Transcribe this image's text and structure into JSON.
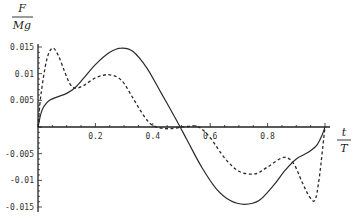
{
  "chart_data": {
    "type": "line",
    "title": "",
    "xlabel": "t / T",
    "ylabel": "F / Mg",
    "xlabel_num": "t",
    "xlabel_den": "T",
    "ylabel_num": "F",
    "ylabel_den": "Mg",
    "xlim": [
      0,
      1
    ],
    "ylim": [
      -0.015,
      0.015
    ],
    "grid": false,
    "legend": null,
    "xticks": [
      0.2,
      0.4,
      0.6,
      0.8
    ],
    "xtick_labels": [
      "0.2",
      "0.4",
      "0.6",
      "0.8"
    ],
    "yticks": [
      0.015,
      0.01,
      0.005,
      -0.005,
      -0.01,
      -0.015
    ],
    "ytick_labels": [
      "0.015",
      "0.01",
      "0.005",
      "-0.005",
      "-0.01",
      "-0.015"
    ],
    "series": [
      {
        "name": "solid",
        "style": "solid",
        "x": [
          0,
          0.01,
          0.02,
          0.04,
          0.07,
          0.1,
          0.13,
          0.16,
          0.2,
          0.25,
          0.29,
          0.33,
          0.38,
          0.43,
          0.48,
          0.52,
          0.57,
          0.62,
          0.67,
          0.72,
          0.77,
          0.82,
          0.86,
          0.9,
          0.94,
          0.97,
          0.99,
          1.0
        ],
        "values": [
          0,
          0.0025,
          0.0038,
          0.005,
          0.0057,
          0.0063,
          0.0074,
          0.0092,
          0.0117,
          0.014,
          0.0148,
          0.0142,
          0.011,
          0.0063,
          0.0015,
          -0.0025,
          -0.0075,
          -0.0115,
          -0.0138,
          -0.0145,
          -0.0138,
          -0.011,
          -0.0082,
          -0.006,
          -0.0048,
          -0.0035,
          -0.0015,
          0
        ]
      },
      {
        "name": "dashed",
        "style": "dashed",
        "x": [
          0,
          0.01,
          0.03,
          0.05,
          0.07,
          0.09,
          0.11,
          0.13,
          0.16,
          0.2,
          0.245,
          0.29,
          0.33,
          0.37,
          0.4,
          0.44,
          0.48,
          0.52,
          0.56,
          0.6,
          0.65,
          0.7,
          0.755,
          0.8,
          0.855,
          0.89,
          0.92,
          0.945,
          0.965,
          0.98,
          1.0
        ],
        "values": [
          0,
          0.006,
          0.0125,
          0.0148,
          0.0135,
          0.0108,
          0.0082,
          0.0073,
          0.0078,
          0.0092,
          0.0098,
          0.0088,
          0.0055,
          0.002,
          0.0003,
          -0.0003,
          -0.0002,
          0.0001,
          0.0,
          -0.002,
          -0.0058,
          -0.0083,
          -0.0088,
          -0.0075,
          -0.0057,
          -0.0068,
          -0.0103,
          -0.013,
          -0.0137,
          -0.0095,
          0
        ]
      }
    ]
  }
}
